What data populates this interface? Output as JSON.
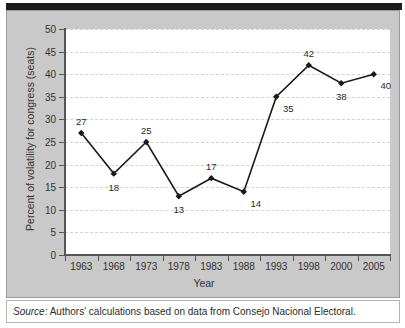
{
  "figure": {
    "background_color": "#c9c9c9",
    "plot_background_color": "#ffffff",
    "line_color": "#1a1a1a",
    "grid_color": "#d9cfcf",
    "axis_color": "#555555"
  },
  "source": {
    "prefix": "Source:",
    "text": "Authors' calculations based on data from Consejo Nacional Electoral."
  },
  "chart_data": {
    "type": "line",
    "title": "",
    "xlabel": "Year",
    "ylabel": "Percent of volatility for congress (seats)",
    "categories": [
      "1963",
      "1968",
      "1973",
      "1978",
      "1983",
      "1988",
      "1993",
      "1998",
      "2000",
      "2005"
    ],
    "values": [
      27,
      18,
      25,
      13,
      17,
      14,
      35,
      42,
      38,
      40
    ],
    "point_labels": [
      "27",
      "18",
      "25",
      "13",
      "17",
      "14",
      "35",
      "42",
      "38",
      "40"
    ],
    "label_positions": [
      "above",
      "below",
      "above",
      "below",
      "above",
      "below-right",
      "below-right",
      "above",
      "below",
      "below-right"
    ],
    "ylim": [
      0,
      50
    ],
    "yticks": [
      0,
      5,
      10,
      15,
      20,
      25,
      30,
      35,
      40,
      45,
      50
    ],
    "ytick_labels": [
      "0",
      "5",
      "10",
      "15",
      "20",
      "25",
      "30",
      "35",
      "40",
      "45",
      "50"
    ],
    "grid": true,
    "grid_style": "dashed-horizontal",
    "legend": null,
    "marker": "diamond",
    "marker_color": "#1a1a1a"
  }
}
